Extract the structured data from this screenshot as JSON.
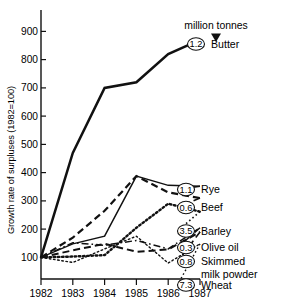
{
  "chart_data": {
    "type": "line",
    "title": "",
    "subtitle": "",
    "xlabel": "",
    "ylabel": "Growth rate of surpluses (1982=100)",
    "x": [
      "1982",
      "1983",
      "1984",
      "1985",
      "1986",
      "1987"
    ],
    "xtick_labels": [
      "1982",
      "1983",
      "1984",
      "1985",
      "1986",
      "1987"
    ],
    "ytick_labels": [
      "100",
      "200",
      "300",
      "400",
      "500",
      "600",
      "700",
      "800",
      "900"
    ],
    "ylim": [
      55,
      960
    ],
    "xlim": [
      1982,
      1987
    ],
    "grid": false,
    "legend_position": "right-inline",
    "annotation": {
      "text": "million tonnes",
      "arrow": "down-triangle",
      "points_to": "butter-value-bubble"
    },
    "value_unit": "million tonnes",
    "series": [
      {
        "name": "Butter",
        "value_1987": "1.2",
        "line_style": "solid",
        "line_width": 2.5,
        "values": [
          100,
          470,
          700,
          720,
          820,
          870
        ]
      },
      {
        "name": "Rye",
        "value_1987": "1.1",
        "line_style": "solid",
        "line_width": 1.5,
        "values": [
          100,
          148,
          175,
          388,
          355,
          352
        ]
      },
      {
        "name": "Beef",
        "value_1987": "0.6",
        "line_style": "dashed",
        "line_width": 2.2,
        "values": [
          100,
          170,
          265,
          388,
          330,
          310
        ]
      },
      {
        "name": "Barley",
        "value_1987": "3.5",
        "line_style": "dotted",
        "line_width": 2.4,
        "values": [
          100,
          103,
          108,
          205,
          290,
          262
        ]
      },
      {
        "name": "Olive oil",
        "value_1987": "0.3",
        "line_style": "dashdot",
        "line_width": 1.5,
        "values": [
          100,
          152,
          143,
          160,
          130,
          205
        ]
      },
      {
        "name": "Skimmed milk powder",
        "value_1987": "0.8",
        "line_style": "dashed",
        "line_width": 2.0,
        "values": [
          100,
          125,
          148,
          120,
          128,
          190
        ]
      },
      {
        "name": "Wheat",
        "value_1987": "7.3",
        "line_style": "dotted",
        "line_width": 1.4,
        "values": [
          100,
          82,
          130,
          175,
          80,
          148
        ]
      }
    ],
    "legend_entries": [
      {
        "bubble": "1.2",
        "label": "Butter"
      },
      {
        "bubble": "1.1",
        "label": "Rye"
      },
      {
        "bubble": "0.6",
        "label": "Beef"
      },
      {
        "bubble": "3.5",
        "label": "Barley"
      },
      {
        "bubble": "0.3",
        "label": "Olive oil"
      },
      {
        "bubble": "0.8",
        "label": "Skimmed",
        "label2": "milk powder"
      },
      {
        "bubble": "7.3",
        "label": "Wheat"
      }
    ]
  },
  "colors": {
    "ink": "#111111",
    "background": "#ffffff"
  }
}
